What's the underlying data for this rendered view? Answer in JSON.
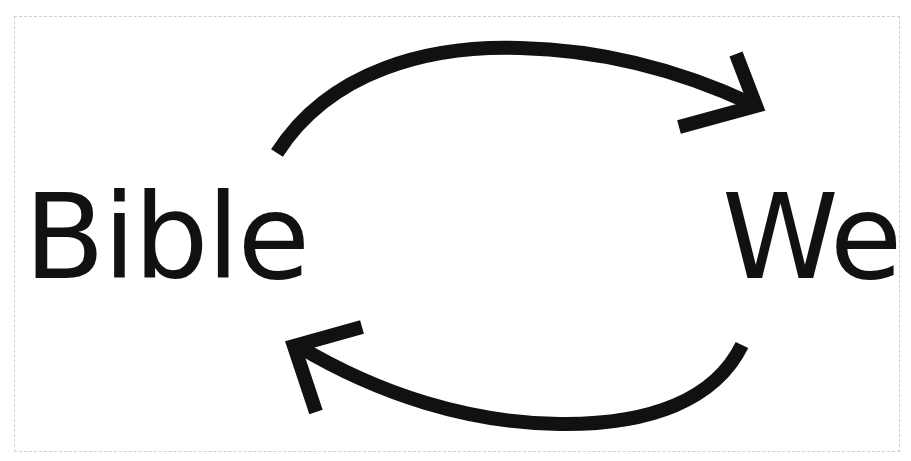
{
  "diagram": {
    "type": "cycle",
    "nodes": [
      {
        "id": "left",
        "label": "Bible"
      },
      {
        "id": "right",
        "label": "We"
      }
    ],
    "edges": [
      {
        "from": "left",
        "to": "right",
        "style": "curved-arrow-top"
      },
      {
        "from": "right",
        "to": "left",
        "style": "curved-arrow-bottom"
      }
    ],
    "colors": {
      "stroke": "#111111",
      "border": "#cfcfcf",
      "background": "#ffffff"
    }
  }
}
